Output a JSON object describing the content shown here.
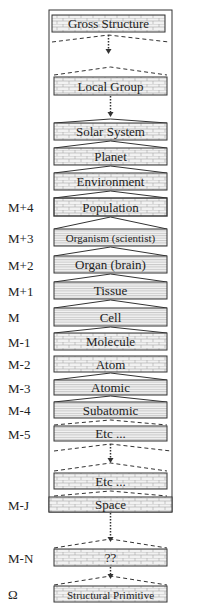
{
  "diagram": {
    "colors": {
      "stroke": "#333333",
      "text": "#222222",
      "brick_fill": "#f2f2f2",
      "brick_line": "#9a9a9a",
      "hatch_line": "#a8a8a8",
      "background": "#ffffff"
    },
    "levels": [
      {
        "id": "gross-structure",
        "label": "Gross Structure",
        "side_label": "",
        "y": 15,
        "h": 17,
        "x": 52,
        "w": 113,
        "pattern": "brick",
        "connector_below": "dashed-arrow"
      },
      {
        "id": "local-group",
        "label": "Local Group",
        "side_label": "",
        "y": 77,
        "h": 18,
        "x": 54,
        "w": 113,
        "pattern": "brick",
        "connector_below": "dotted-arrow"
      },
      {
        "id": "solar-system",
        "label": "Solar System",
        "side_label": "",
        "y": 123,
        "h": 17,
        "x": 54,
        "w": 113,
        "pattern": "brick",
        "connector_below": "chevron"
      },
      {
        "id": "planet",
        "label": "Planet",
        "side_label": "",
        "y": 148,
        "h": 17,
        "x": 54,
        "w": 113,
        "pattern": "brick",
        "connector_below": "chevron"
      },
      {
        "id": "environment",
        "label": "Environment",
        "side_label": "",
        "y": 173,
        "h": 17,
        "x": 54,
        "w": 113,
        "pattern": "brick",
        "connector_below": "chevron"
      },
      {
        "id": "population",
        "label": "Population",
        "side_label": "M+4",
        "y": 198,
        "h": 18,
        "x": 54,
        "w": 113,
        "pattern": "brick-bold",
        "connector_below": "line"
      },
      {
        "id": "organism",
        "label": "Organism (scientist)",
        "side_label": "M+3",
        "y": 229,
        "h": 17,
        "x": 54,
        "w": 113,
        "pattern": "hatch",
        "connector_below": "chevron"
      },
      {
        "id": "organ",
        "label": "Organ (brain)",
        "side_label": "M+2",
        "y": 256,
        "h": 17,
        "x": 54,
        "w": 113,
        "pattern": "hatch",
        "connector_below": "chevron"
      },
      {
        "id": "tissue",
        "label": "Tissue",
        "side_label": "M+1",
        "y": 282,
        "h": 17,
        "x": 54,
        "w": 113,
        "pattern": "hatch",
        "connector_below": "chevron"
      },
      {
        "id": "cell",
        "label": "Cell",
        "side_label": "M",
        "y": 308,
        "h": 18,
        "x": 54,
        "w": 113,
        "pattern": "hatch",
        "connector_below": "chevron"
      },
      {
        "id": "molecule",
        "label": "Molecule",
        "side_label": "M-1",
        "y": 333,
        "h": 17,
        "x": 54,
        "w": 113,
        "pattern": "brick",
        "connector_below": "none"
      },
      {
        "id": "atom",
        "label": "Atom",
        "side_label": "M-2",
        "y": 356,
        "h": 16,
        "x": 54,
        "w": 113,
        "pattern": "brick",
        "connector_below": "chevron"
      },
      {
        "id": "atomic",
        "label": "Atomic",
        "side_label": "M-3",
        "y": 380,
        "h": 15,
        "x": 54,
        "w": 113,
        "pattern": "hatch",
        "connector_below": "chevron"
      },
      {
        "id": "subatomic",
        "label": "Subatomic",
        "side_label": "M-4",
        "y": 402,
        "h": 16,
        "x": 54,
        "w": 113,
        "pattern": "hatch",
        "connector_below": "dashed"
      },
      {
        "id": "etc-upper",
        "label": "Etc    ...",
        "side_label": "M-5",
        "y": 426,
        "h": 15,
        "x": 54,
        "w": 113,
        "pattern": "hatch",
        "connector_below": "dashed-arrow"
      },
      {
        "id": "etc-lower",
        "label": "Etc     ...",
        "side_label": "",
        "y": 473,
        "h": 16,
        "x": 54,
        "w": 113,
        "pattern": "brick",
        "connector_below": "dashed"
      },
      {
        "id": "space",
        "label": "Space",
        "side_label": "M-J",
        "y": 497,
        "h": 15,
        "x": 49,
        "w": 123,
        "pattern": "brick",
        "connector_below": "dotted-arrow-dashed"
      },
      {
        "id": "unknown",
        "label": "??",
        "side_label": "M-N",
        "y": 549,
        "h": 17,
        "x": 54,
        "w": 113,
        "pattern": "brick",
        "connector_below": "dotted-arrow-dashed"
      },
      {
        "id": "structural-primitive",
        "label": "Structural Primitive",
        "side_label": "Ω",
        "y": 586,
        "h": 16,
        "x": 54,
        "w": 113,
        "pattern": "brick",
        "connector_below": "none"
      }
    ],
    "frame": {
      "x": 49,
      "y": 10,
      "w": 123,
      "h": 502
    }
  }
}
